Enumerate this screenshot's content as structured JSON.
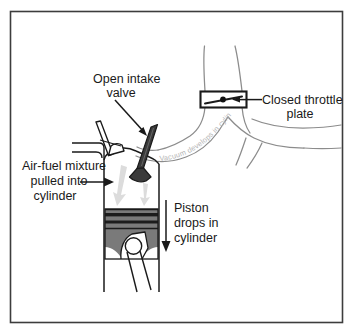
{
  "figure": {
    "border_color": "#3d3d3d",
    "background": "#ffffff"
  },
  "colors": {
    "ink": "#1a1a1a",
    "outline_gray": "#8c8c8c",
    "piston_body": "#7a7a7a",
    "piston_ring": "#1c1c1c",
    "valve_dark": "#3a3a3a",
    "flow_arrow": "#d9d9d9",
    "vacuum_text": "#b6b6b6",
    "throttle_box": "#1a1a1a"
  },
  "labels": {
    "open_intake_valve": {
      "name": "open-intake-valve-label",
      "lines": [
        "Open intake",
        "valve"
      ]
    },
    "closed_throttle_plate": {
      "name": "closed-throttle-plate-label",
      "lines": [
        "Closed throttle",
        "plate"
      ]
    },
    "air_fuel_mixture": {
      "name": "air-fuel-mixture-label",
      "lines": [
        "Air-fuel mixture",
        "pulled into",
        "cylinder"
      ]
    },
    "piston_drops": {
      "name": "piston-drops-label",
      "lines": [
        "Piston",
        "drops in",
        "cylinder"
      ]
    },
    "vacuum_develops": {
      "name": "vacuum-develops-label",
      "text": "Vacuum develops in cylinder"
    }
  },
  "parts": {
    "throttle_plate": "closed-throttle-plate",
    "intake_valve": "open-intake-valve",
    "exhaust_valve": "closed-exhaust-valve",
    "piston": "piston",
    "connecting_rod": "connecting-rod",
    "wrist_pin": "wrist-pin",
    "cylinder_wall_left": "cylinder-wall-left",
    "cylinder_wall_right": "cylinder-wall-right",
    "intake_manifold": "intake-manifold-runner"
  }
}
